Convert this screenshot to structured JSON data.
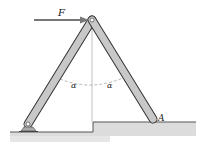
{
  "diagram": {
    "type": "statics-frame",
    "labels": {
      "force": "F",
      "angle_left": "α",
      "angle_right": "α",
      "point_a": "A"
    },
    "colors": {
      "member_fill": "#c8c8c8",
      "member_stroke": "#333333",
      "ground_fill": "#d4d4d4",
      "ground_top": "#555555",
      "arrow": "#777777",
      "centerline": "#999999"
    },
    "geometry": {
      "apex": [
        92,
        20
      ],
      "left_base": [
        28,
        124
      ],
      "right_base": [
        153,
        120
      ],
      "step_x": 93,
      "ground_low_y": 132,
      "ground_high_y": 122
    }
  }
}
